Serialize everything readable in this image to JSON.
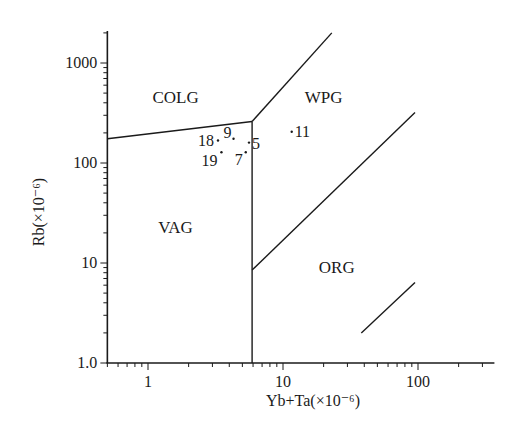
{
  "chart_data": {
    "type": "scatter",
    "title": "",
    "xlabel": "Yb+Ta(×10⁻⁶)",
    "ylabel": "Rb(×10⁻⁶)",
    "xscale": "log",
    "yscale": "log",
    "xlim": [
      0.5,
      300
    ],
    "ylim": [
      1,
      2000
    ],
    "grid": false,
    "legend": "none",
    "x_tick_labels": [
      "1",
      "10",
      "100"
    ],
    "y_tick_labels": [
      "1.0",
      "10",
      "100",
      "1000"
    ],
    "field_labels": [
      {
        "label": "COLG",
        "x": 1.6,
        "y": 400
      },
      {
        "label": "WPG",
        "x": 20,
        "y": 400
      },
      {
        "label": "VAG",
        "x": 1.6,
        "y": 20
      },
      {
        "label": "ORG",
        "x": 25,
        "y": 8
      }
    ],
    "boundaries": [
      {
        "name": "COLG-VAG",
        "points": [
          [
            0.5,
            175
          ],
          [
            5.9,
            260
          ]
        ]
      },
      {
        "name": "WPG-COLG",
        "points": [
          [
            5.9,
            260
          ],
          [
            23,
            2000
          ]
        ]
      },
      {
        "name": "VAG-vertical",
        "points": [
          [
            5.9,
            1
          ],
          [
            5.9,
            260
          ]
        ]
      },
      {
        "name": "WPG-ORG",
        "points": [
          [
            5.9,
            8.5
          ],
          [
            95,
            320
          ]
        ]
      },
      {
        "name": "ORG-inner",
        "points": [
          [
            38,
            2
          ],
          [
            95,
            6.4
          ]
        ]
      }
    ],
    "points": [
      {
        "label": "18",
        "x": 3.3,
        "y": 168
      },
      {
        "label": "9",
        "x": 4.3,
        "y": 175
      },
      {
        "label": "5",
        "x": 5.6,
        "y": 160
      },
      {
        "label": "19",
        "x": 3.5,
        "y": 128
      },
      {
        "label": "7",
        "x": 5.3,
        "y": 128
      },
      {
        "label": "11",
        "x": 11.6,
        "y": 205
      }
    ]
  }
}
